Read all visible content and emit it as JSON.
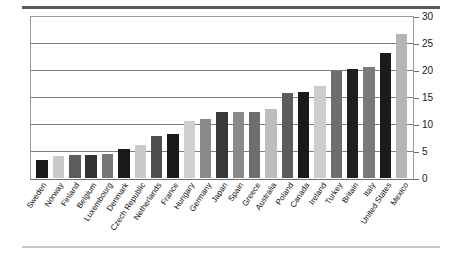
{
  "figure": {
    "top_rule_color": "#5a5a5a",
    "bottom_rule_color": "#c9c9c9",
    "plot_border_color": "#9a9a9a",
    "gridline_color": "#7d7d7d",
    "background": "#ffffff"
  },
  "chart_data": {
    "type": "bar",
    "title": "",
    "subtitle": "",
    "xlabel": "",
    "ylabel": "",
    "ylim": [
      0,
      30
    ],
    "yticks": [
      0,
      5,
      10,
      15,
      20,
      25,
      30
    ],
    "ytick_labels": [
      "0",
      "5",
      "10",
      "15",
      "20",
      "25",
      "30"
    ],
    "grid": true,
    "legend": "none",
    "axis_label_rotation": -56,
    "categories": [
      "Sweden",
      "Norway",
      "Finland",
      "Belgium",
      "Luxembourg",
      "Denmark",
      "Czech Republic",
      "Netherlands",
      "France",
      "Hungary",
      "Germany",
      "Japan",
      "Spain",
      "Greece",
      "Australia",
      "Poland",
      "Canada",
      "Ireland",
      "Turkey",
      "Britain",
      "Italy",
      "United States",
      "Mexico"
    ],
    "values": [
      3.4,
      4.0,
      4.2,
      4.2,
      4.5,
      5.4,
      6.2,
      7.8,
      8.1,
      10.6,
      11.0,
      12.3,
      12.3,
      12.3,
      12.8,
      15.7,
      15.9,
      17.1,
      19.8,
      20.2,
      20.5,
      23.2,
      26.7
    ],
    "bar_colors": [
      "#1a1a1a",
      "#c9c9c9",
      "#5c5c5c",
      "#333333",
      "#777777",
      "#1a1a1a",
      "#c9c9c9",
      "#4f4f4f",
      "#1a1a1a",
      "#cfcfcf",
      "#8a8a8a",
      "#3a3a3a",
      "#8a8a8a",
      "#6e6e6e",
      "#bdbdbd",
      "#5c5c5c",
      "#1a1a1a",
      "#cccccc",
      "#6e6e6e",
      "#1f1f1f",
      "#7a7a7a",
      "#1a1a1a",
      "#b5b5b5"
    ]
  }
}
